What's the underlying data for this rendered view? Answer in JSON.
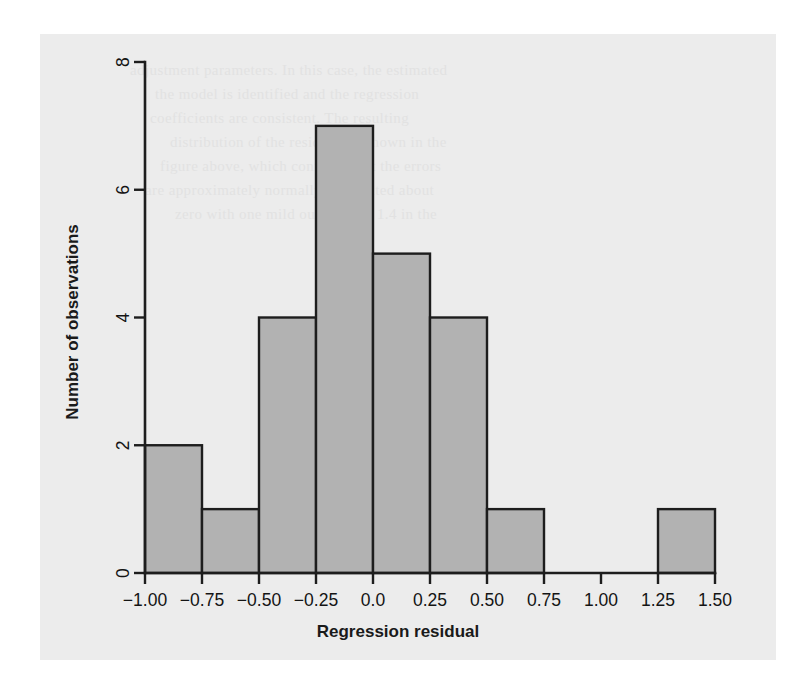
{
  "figure": {
    "background_color": "#ffffff",
    "page_color": "#ececec",
    "ink_color": "#1d1d1d"
  },
  "chart_data": {
    "type": "bar",
    "subtype": "histogram",
    "title": "",
    "xlabel": "Regression residual",
    "ylabel": "Number of observations",
    "xlim": [
      -1.0,
      1.5
    ],
    "ylim": [
      0,
      8
    ],
    "grid": false,
    "legend": false,
    "bin_width": 0.25,
    "bin_edges": [
      -1.0,
      -0.75,
      -0.5,
      -0.25,
      0.0,
      0.25,
      0.5,
      0.75,
      1.0,
      1.25,
      1.5
    ],
    "categories": [
      "-1.00 to -0.75",
      "-0.75 to -0.50",
      "-0.50 to -0.25",
      "-0.25 to 0.00",
      "0.00 to 0.25",
      "0.25 to 0.50",
      "0.50 to 0.75",
      "0.75 to 1.00",
      "1.00 to 1.25",
      "1.25 to 1.50"
    ],
    "values": [
      2,
      1,
      4,
      7,
      5,
      4,
      1,
      0,
      0,
      1
    ],
    "bar_fill_color": "#b2b2b2",
    "bar_edge_color": "#1d1d1d",
    "xticks": [
      -1.0,
      -0.75,
      -0.5,
      -0.25,
      0.0,
      0.25,
      0.5,
      0.75,
      1.0,
      1.25,
      1.5
    ],
    "xticklabels": [
      "−1.00",
      "−0.75",
      "−0.50",
      "−0.25",
      "0.0",
      "0.25",
      "0.50",
      "0.75",
      "1.00",
      "1.25",
      "1.50"
    ],
    "yticks": [
      0,
      2,
      4,
      6,
      8
    ],
    "yticklabels": [
      "0",
      "2",
      "4",
      "6",
      "8"
    ],
    "ytick_label_rotation": 90,
    "total_observations": 25
  },
  "ghost_text": [
    {
      "text": "adjustment parameters. In this case, the estimated",
      "x": 130,
      "y": 62,
      "w": 520
    },
    {
      "text": "the model is identified and the regression",
      "x": 155,
      "y": 86,
      "w": 470
    },
    {
      "text": "coefficients are consistent. The resulting",
      "x": 150,
      "y": 110,
      "w": 450
    },
    {
      "text": "distribution of the residuals is shown in the",
      "x": 170,
      "y": 134,
      "w": 470
    },
    {
      "text": "figure above, which confirms that the errors",
      "x": 160,
      "y": 158,
      "w": 460
    },
    {
      "text": "are approximately normally distributed about",
      "x": 145,
      "y": 182,
      "w": 480
    },
    {
      "text": "zero with one mild outlier near 1.4 in the",
      "x": 175,
      "y": 206,
      "w": 440
    }
  ]
}
